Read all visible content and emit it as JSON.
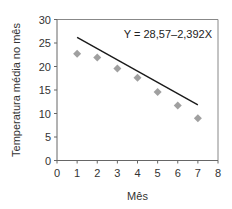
{
  "chart_data": {
    "type": "scatter",
    "title": "",
    "xlabel": "Mês",
    "ylabel": "Temperatura média no mês",
    "xlim": [
      0,
      8
    ],
    "ylim": [
      0,
      30
    ],
    "xticks": [
      0,
      1,
      2,
      3,
      4,
      5,
      6,
      7,
      8
    ],
    "yticks": [
      0,
      5,
      10,
      15,
      20,
      25,
      30
    ],
    "grid": false,
    "series": [
      {
        "name": "Temperatura média",
        "marker": "diamond",
        "color": "#a0a0a0",
        "x": [
          1,
          2,
          3,
          4,
          5,
          6,
          7
        ],
        "y": [
          22.7,
          21.9,
          19.6,
          17.6,
          14.6,
          11.7,
          9.0
        ]
      }
    ],
    "trendline": {
      "intercept": 28.57,
      "slope": -2.392,
      "x_range": [
        1,
        7
      ],
      "color": "#1a1a1a"
    },
    "annotation": "Y = 28,57–2,392X"
  }
}
